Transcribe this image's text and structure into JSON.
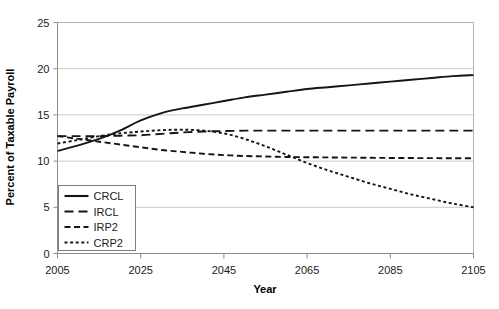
{
  "chart_data": {
    "type": "line",
    "title": "",
    "xlabel": "Year",
    "ylabel": "Percent of Taxable Payroll",
    "xlim": [
      2005,
      2105
    ],
    "ylim": [
      0,
      25
    ],
    "xticks": [
      "2005",
      "2025",
      "2045",
      "2065",
      "2085",
      "2105"
    ],
    "yticks": [
      "0",
      "5",
      "10",
      "15",
      "20",
      "25"
    ],
    "grid": "horizontal",
    "legend_position": "lower-left-inside",
    "x": [
      2005,
      2010,
      2015,
      2020,
      2025,
      2030,
      2035,
      2040,
      2045,
      2050,
      2055,
      2060,
      2065,
      2070,
      2075,
      2080,
      2085,
      2090,
      2095,
      2100,
      2105
    ],
    "series": [
      {
        "name": "CRCL",
        "dash": "solid",
        "values": [
          11.1,
          11.7,
          12.4,
          13.3,
          14.4,
          15.2,
          15.7,
          16.1,
          16.5,
          16.9,
          17.2,
          17.5,
          17.8,
          18.0,
          18.2,
          18.4,
          18.6,
          18.8,
          19.0,
          19.2,
          19.3
        ]
      },
      {
        "name": "IRCL",
        "dash": "long-dash",
        "values": [
          12.7,
          12.7,
          12.7,
          12.75,
          12.8,
          12.95,
          13.1,
          13.2,
          13.25,
          13.3,
          13.3,
          13.3,
          13.3,
          13.3,
          13.3,
          13.3,
          13.3,
          13.3,
          13.3,
          13.3,
          13.3
        ]
      },
      {
        "name": "IRP2",
        "dash": "medium-dash",
        "values": [
          12.7,
          12.4,
          12.1,
          11.8,
          11.5,
          11.2,
          11.0,
          10.8,
          10.65,
          10.55,
          10.5,
          10.45,
          10.42,
          10.4,
          10.38,
          10.36,
          10.34,
          10.33,
          10.32,
          10.31,
          10.3
        ]
      },
      {
        "name": "CRP2",
        "dash": "short-dash",
        "values": [
          11.9,
          12.3,
          12.7,
          13.0,
          13.2,
          13.35,
          13.4,
          13.3,
          13.0,
          12.4,
          11.6,
          10.7,
          9.8,
          9.0,
          8.3,
          7.6,
          7.0,
          6.4,
          5.9,
          5.4,
          5.0
        ]
      }
    ],
    "legend": [
      {
        "label": "CRCL",
        "dash": "solid"
      },
      {
        "label": "IRCL",
        "dash": "long-dash"
      },
      {
        "label": "IRP2",
        "dash": "medium-dash"
      },
      {
        "label": "CRP2",
        "dash": "short-dash"
      }
    ]
  }
}
